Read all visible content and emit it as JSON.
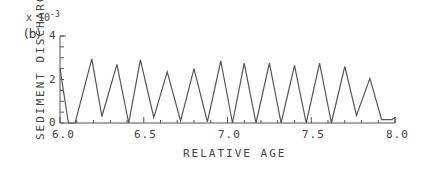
{
  "panel_label": "(b)",
  "y_multiplier": {
    "base": "x 10",
    "exponent": "-3"
  },
  "chart_data": {
    "type": "line",
    "title": "",
    "xlabel": "RELATIVE AGE",
    "ylabel": "SEDIMENT DISCHARGE",
    "y_scale_note": "x 10^-3",
    "xlim": [
      6.0,
      8.0
    ],
    "ylim": [
      0,
      4
    ],
    "x_ticks": [
      "6.0",
      "6.5",
      "7.0",
      "7.5",
      "8.0"
    ],
    "y_ticks": [
      "0",
      "2",
      "4"
    ],
    "grid": false,
    "legend": null,
    "series": [
      {
        "name": "sediment discharge",
        "x": [
          6.0,
          6.05,
          6.09,
          6.19,
          6.25,
          6.34,
          6.41,
          6.48,
          6.56,
          6.64,
          6.72,
          6.8,
          6.88,
          6.96,
          7.03,
          7.1,
          7.17,
          7.25,
          7.32,
          7.4,
          7.47,
          7.55,
          7.62,
          7.7,
          7.77,
          7.85,
          7.92,
          7.98,
          8.0
        ],
        "values": [
          2.5,
          0.0,
          0.0,
          2.95,
          0.3,
          2.7,
          0.0,
          2.9,
          0.25,
          2.35,
          0.1,
          2.5,
          0.05,
          2.85,
          0.0,
          2.75,
          0.0,
          2.75,
          0.0,
          2.65,
          0.0,
          2.75,
          0.0,
          2.6,
          0.35,
          2.05,
          0.15,
          0.15,
          0.25
        ]
      }
    ]
  }
}
